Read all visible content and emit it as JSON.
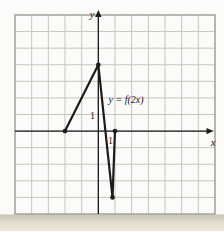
{
  "figure": {
    "curve_label": "y = f(2x)",
    "x_axis_label": "x",
    "y_axis_label": "y",
    "x_tick_label": "1",
    "y_tick_label": "1"
  },
  "chart_data": {
    "type": "line",
    "title": "",
    "xlabel": "x",
    "ylabel": "y",
    "xlim": [
      -5,
      7
    ],
    "ylim": [
      -5,
      7
    ],
    "grid": true,
    "grid_step": 1,
    "legend": "none",
    "tick_labels_shown": {
      "x": [
        1
      ],
      "y": [
        1
      ]
    },
    "annotations": [
      {
        "text": "y = f(2x)",
        "x": 0.6,
        "y": 1.7,
        "anchor": "start"
      }
    ],
    "series": [
      {
        "name": "y = f(2x)",
        "points": [
          [
            -2,
            0
          ],
          [
            0,
            4
          ],
          [
            0.85,
            -4
          ],
          [
            1,
            0
          ]
        ],
        "marker_points": [
          [
            -2,
            0
          ],
          [
            0,
            4
          ],
          [
            0.85,
            -4
          ],
          [
            1,
            0
          ]
        ],
        "color": "#1b1b1b"
      }
    ],
    "colors": {
      "page_background": "#fcfbf9",
      "grid_line": "#c4c7bf",
      "grid_border": "#9a9c94",
      "axis": "#1b1b1b",
      "curve": "#1b1b1b",
      "marker": "#1b1b1b",
      "text": "#222222",
      "shadow_band_top": "#b7afa0",
      "shadow_band_bottom": "#e9e3d5"
    }
  }
}
